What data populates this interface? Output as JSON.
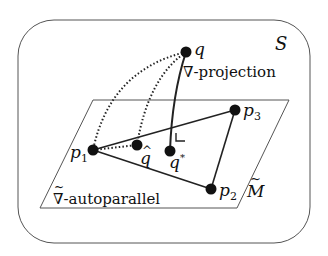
{
  "diagram": {
    "space_label": "S",
    "submanifold_label": "M",
    "submanifold_tilde": "~",
    "projection_label": "∇-projection",
    "autoparallel_label": "∇-autoparallel",
    "autoparallel_tilde": "~",
    "points": {
      "q": {
        "label": "q",
        "x": 186,
        "y": 52
      },
      "p1": {
        "label": "p",
        "sub": "1",
        "x": 93,
        "y": 150
      },
      "p2": {
        "label": "p",
        "sub": "2",
        "x": 211,
        "y": 189
      },
      "p3": {
        "label": "p",
        "sub": "3",
        "x": 235,
        "y": 110
      },
      "q_hat": {
        "label": "q",
        "accent": "^",
        "x": 137,
        "y": 145
      },
      "q_star": {
        "label": "q",
        "sup": "*",
        "x": 170,
        "y": 151
      }
    },
    "colors": {
      "stroke": "#222222",
      "background": "#ffffff"
    }
  }
}
